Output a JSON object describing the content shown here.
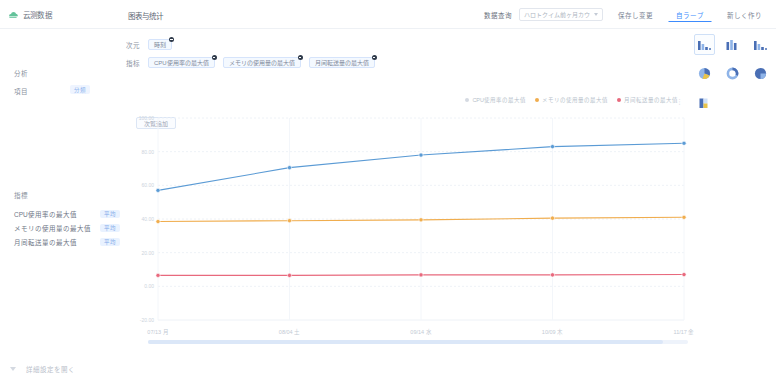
{
  "app": {
    "brand": "云测数据",
    "page_title": "图表与统计"
  },
  "topbar": {
    "filter_label": "数据查询",
    "select_value": "ハロトクイム前ヶ月カウ",
    "buttons": [
      {
        "label": "保存し变更",
        "state": "default"
      },
      {
        "label": "自ラーブ",
        "state": "active"
      },
      {
        "label": "新しく作り",
        "state": "default"
      }
    ]
  },
  "filters": {
    "dimension_label": "次元",
    "metric_label": "指标",
    "left_dimension_label": "分析",
    "left_metric_label": "項目",
    "left_metric_tag": "分類",
    "dimension_chips": [
      {
        "label": "時刻"
      }
    ],
    "metric_chips": [
      {
        "label": "CPU使用率の最大值"
      },
      {
        "label": "メモリの使用量の最大值"
      },
      {
        "label": "月间転送量の最大值"
      }
    ],
    "add_button": "次覧追加"
  },
  "sidebar": {
    "title": "指標",
    "items": [
      {
        "label": "CPU使用率の最大值",
        "tag": "平均"
      },
      {
        "label": "メモリの使用量の最大值",
        "tag": "平均"
      },
      {
        "label": "月间転送量の最大值",
        "tag": "平均"
      }
    ]
  },
  "legend": {
    "entries": [
      {
        "label": "CPU使用率の最大值",
        "color": "#5b9bd5",
        "active": false
      },
      {
        "label": "メモリの使用量の最大值",
        "color": "#f0ad4e",
        "active": true
      },
      {
        "label": "月间転送量の最大值",
        "color": "#e8697d",
        "active": true
      }
    ],
    "menu_icon": "more-vertical-icon"
  },
  "chart_data": {
    "type": "line",
    "title": "",
    "xlabel": "",
    "ylabel": "",
    "grid": true,
    "legend_position": "top-right",
    "categories": [
      "07/13 月",
      "08/04 土",
      "09/14 水",
      "10/09 木",
      "11/17 金"
    ],
    "ytick_labels": [
      "100.00",
      "80.00",
      "60.00",
      "40.00",
      "20.00",
      "0.00",
      "-20.00"
    ],
    "ylim": [
      -20,
      100
    ],
    "series": [
      {
        "name": "CPU使用率の最大值",
        "color": "#5b9bd5",
        "values": [
          57.0,
          70.5,
          78.0,
          83.0,
          85.0
        ]
      },
      {
        "name": "メモリの使用量の最大值",
        "color": "#f0ad4e",
        "values": [
          38.5,
          39.0,
          39.5,
          40.5,
          41.0
        ]
      },
      {
        "name": "月间転送量の最大值",
        "color": "#e8697d",
        "values": [
          6.5,
          6.5,
          6.8,
          6.8,
          7.0
        ]
      }
    ]
  },
  "chart_types": {
    "rows": [
      [
        {
          "name": "bar-chart-descending-icon",
          "selected": true
        },
        {
          "name": "bar-chart-grouped-icon",
          "selected": false
        },
        {
          "name": "bar-chart-mixed-icon",
          "selected": false
        }
      ],
      [
        {
          "name": "pie-chart-icon",
          "selected": false
        },
        {
          "name": "donut-chart-icon",
          "selected": false
        },
        {
          "name": "pie-chart-split-icon",
          "selected": false
        }
      ],
      [
        {
          "name": "stacked-bar-chart-icon",
          "selected": false
        }
      ]
    ]
  },
  "footer": {
    "collapse_icon": "chevron-down-icon",
    "text": "詳細設定を開く"
  },
  "colors": {
    "accent": "#3d8bfd",
    "series_blue": "#5b9bd5",
    "series_orange": "#f0ad4e",
    "series_red": "#e8697d",
    "chip_border": "#d6e4fb",
    "grid": "#eef2f7"
  }
}
